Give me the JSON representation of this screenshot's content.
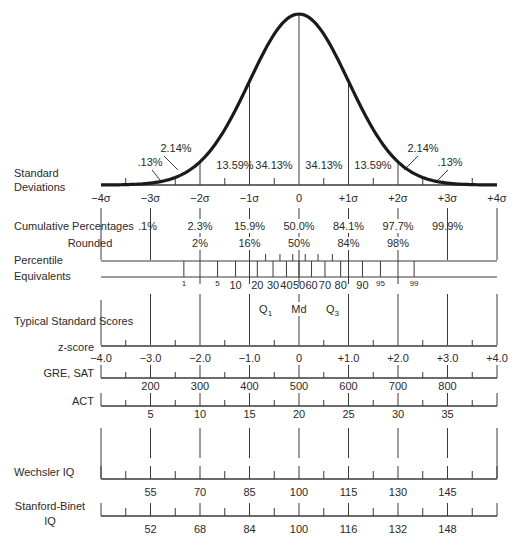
{
  "chart_data": {
    "type": "line",
    "x_sigma": [
      -4,
      -3,
      -2,
      -1,
      0,
      1,
      2,
      3,
      4
    ],
    "sigma_labels": [
      "−4σ",
      "−3σ",
      "−2σ",
      "−1σ",
      "0",
      "+1σ",
      "+2σ",
      "+3σ",
      "+4σ"
    ],
    "area_percentages": [
      {
        "label": ".13%",
        "from": -4,
        "to": -3
      },
      {
        "label": "2.14%",
        "from": -3,
        "to": -2
      },
      {
        "label": "13.59%",
        "from": -2,
        "to": -1
      },
      {
        "label": "34.13%",
        "from": -1,
        "to": 0
      },
      {
        "label": "34.13%",
        "from": 0,
        "to": 1
      },
      {
        "label": "13.59%",
        "from": 1,
        "to": 2
      },
      {
        "label": "2.14%",
        "from": 2,
        "to": 3
      },
      {
        "label": ".13%",
        "from": 3,
        "to": 4
      }
    ],
    "rows": {
      "standard_deviations": {
        "label_lines": [
          "Standard",
          "Deviations"
        ]
      },
      "cumulative_percentages": {
        "label": "Cumulative Percentages",
        "values": [
          {
            "sigma": -3,
            "text": ".1%"
          },
          {
            "sigma": -2,
            "text": "2.3%"
          },
          {
            "sigma": -1,
            "text": "15.9%"
          },
          {
            "sigma": 0,
            "text": "50.0%"
          },
          {
            "sigma": 1,
            "text": "84.1%"
          },
          {
            "sigma": 2,
            "text": "97.7%"
          },
          {
            "sigma": 3,
            "text": "99.9%"
          }
        ]
      },
      "rounded": {
        "label": "Rounded",
        "values": [
          {
            "sigma": -2,
            "text": "2%"
          },
          {
            "sigma": -1,
            "text": "16%"
          },
          {
            "sigma": 0,
            "text": "50%"
          },
          {
            "sigma": 1,
            "text": "84%"
          },
          {
            "sigma": 2,
            "text": "98%"
          }
        ]
      },
      "percentile_equivalents": {
        "label_lines": [
          "Percentile",
          "Equivalents"
        ],
        "ticks": [
          {
            "p": 1,
            "z": -2.326,
            "text": "1",
            "small": true
          },
          {
            "p": 5,
            "z": -1.645,
            "text": "5",
            "small": true
          },
          {
            "p": 10,
            "z": -1.2816,
            "text": "10"
          },
          {
            "p": 20,
            "z": -0.8416,
            "text": "20"
          },
          {
            "p": 30,
            "z": -0.5244,
            "text": "30"
          },
          {
            "p": 40,
            "z": -0.2533,
            "text": "40"
          },
          {
            "p": 50,
            "z": 0,
            "text": "50"
          },
          {
            "p": 60,
            "z": 0.2533,
            "text": "60"
          },
          {
            "p": 70,
            "z": 0.5244,
            "text": "70"
          },
          {
            "p": 80,
            "z": 0.8416,
            "text": "80"
          },
          {
            "p": 90,
            "z": 1.2816,
            "text": "90"
          },
          {
            "p": 95,
            "z": 1.645,
            "text": "95",
            "small": true
          },
          {
            "p": 99,
            "z": 2.326,
            "text": "99",
            "small": true
          }
        ],
        "minor_ticks_z": [
          -0.674,
          -0.385,
          -0.126,
          0.126,
          0.385,
          0.674
        ],
        "quartiles": [
          {
            "z": -0.6745,
            "label": "Q",
            "sub": "1"
          },
          {
            "z": 0,
            "label": "Md",
            "sub": ""
          },
          {
            "z": 0.6745,
            "label": "Q",
            "sub": "3"
          }
        ]
      },
      "typical_standard_scores": {
        "label": "Typical Standard Scores"
      },
      "z_score": {
        "label": "z-score",
        "values": [
          "−4.0",
          "−3.0",
          "−2.0",
          "−1.0",
          "0",
          "+1.0",
          "+2.0",
          "+3.0",
          "+4.0"
        ]
      },
      "gre_sat": {
        "label": "GRE, SAT",
        "values": [
          {
            "sigma": -3,
            "text": "200"
          },
          {
            "sigma": -2,
            "text": "300"
          },
          {
            "sigma": -1,
            "text": "400"
          },
          {
            "sigma": 0,
            "text": "500"
          },
          {
            "sigma": 1,
            "text": "600"
          },
          {
            "sigma": 2,
            "text": "700"
          },
          {
            "sigma": 3,
            "text": "800"
          }
        ]
      },
      "act": {
        "label": "ACT",
        "values": [
          {
            "sigma": -3,
            "text": "5"
          },
          {
            "sigma": -2,
            "text": "10"
          },
          {
            "sigma": -1,
            "text": "15"
          },
          {
            "sigma": 0,
            "text": "20"
          },
          {
            "sigma": 1,
            "text": "25"
          },
          {
            "sigma": 2,
            "text": "30"
          },
          {
            "sigma": 3,
            "text": "35"
          }
        ]
      },
      "wechsler_iq": {
        "label": "Wechsler IQ",
        "values": [
          {
            "sigma": -3,
            "text": "55"
          },
          {
            "sigma": -2,
            "text": "70"
          },
          {
            "sigma": -1,
            "text": "85"
          },
          {
            "sigma": 0,
            "text": "100"
          },
          {
            "sigma": 1,
            "text": "115"
          },
          {
            "sigma": 2,
            "text": "130"
          },
          {
            "sigma": 3,
            "text": "145"
          }
        ]
      },
      "stanford_binet_iq": {
        "label_lines": [
          "Stanford-Binet",
          "IQ"
        ],
        "values": [
          {
            "sigma": -3,
            "text": "52"
          },
          {
            "sigma": -2,
            "text": "68"
          },
          {
            "sigma": -1,
            "text": "84"
          },
          {
            "sigma": 0,
            "text": "100"
          },
          {
            "sigma": 1,
            "text": "116"
          },
          {
            "sigma": 2,
            "text": "132"
          },
          {
            "sigma": 3,
            "text": "148"
          }
        ]
      }
    },
    "layout": {
      "x0": 299,
      "px_per_sigma": 49.5,
      "baseline_y": 185,
      "peak_y": 14,
      "grid": false,
      "legend": "none"
    }
  },
  "colors": {
    "ink": "#2a2a2a",
    "curve": "#1a1a1a",
    "rule": "#3a3a3a",
    "background": "#ffffff"
  }
}
